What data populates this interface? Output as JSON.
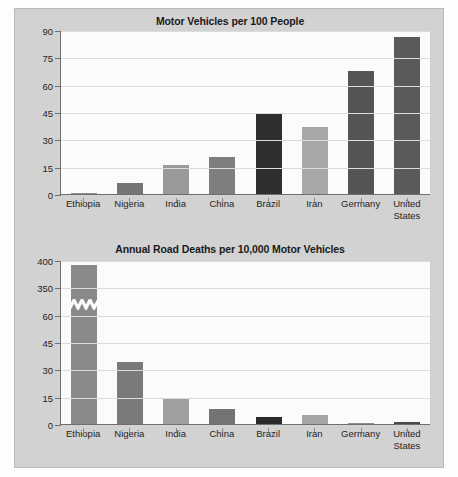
{
  "figure": {
    "background_color": "#d2d2d2",
    "plot_background_color": "#fbfbfb",
    "axis_color": "#6f6f6f",
    "grid_color": "#dcdcdc"
  },
  "charts": [
    {
      "title": "Motor Vehicles per 100 People",
      "yticks": [
        "0",
        "15",
        "30",
        "45",
        "60",
        "75",
        "90"
      ],
      "xlabels": [
        "Ethiopia",
        "Nigeria",
        "India",
        "China",
        "Brazil",
        "Iran",
        "Germany",
        "United\nStates"
      ]
    },
    {
      "title": "Annual Road Deaths per 10,000 Motor Vehicles",
      "yticks": [
        "0",
        "15",
        "30",
        "45",
        "60",
        "350",
        "400"
      ],
      "xlabels": [
        "Ethiopia",
        "Nigeria",
        "India",
        "China",
        "Brazil",
        "Iran",
        "Germany",
        "United\nStates"
      ]
    }
  ],
  "chart_data": [
    {
      "type": "bar",
      "title": "Motor Vehicles per 100 People",
      "xlabel": "",
      "ylabel": "",
      "categories": [
        "Ethiopia",
        "Nigeria",
        "India",
        "China",
        "Brazil",
        "Iran",
        "Germany",
        "United States"
      ],
      "values": [
        0.5,
        6,
        16,
        20.5,
        44,
        37,
        67.5,
        86
      ],
      "bar_colors": [
        "#8f8f8f",
        "#757575",
        "#9a9a9a",
        "#7e7e7e",
        "#2f2f2f",
        "#a8a8a8",
        "#555555",
        "#5a5a5a"
      ],
      "ylim": [
        0,
        90
      ],
      "ytick_values": [
        0,
        15,
        30,
        45,
        60,
        75,
        90
      ],
      "grid": true,
      "broken_axis": false,
      "legend": "none"
    },
    {
      "type": "bar",
      "title": "Annual Road Deaths per 10,000 Motor Vehicles",
      "xlabel": "",
      "ylabel": "",
      "categories": [
        "Ethiopia",
        "Nigeria",
        "India",
        "China",
        "Brazil",
        "Iran",
        "Germany",
        "United States"
      ],
      "values": [
        390,
        34,
        14.5,
        8,
        4,
        4.8,
        0.3,
        1
      ],
      "bar_colors": [
        "#8a8a8a",
        "#7a7a7a",
        "#a0a0a0",
        "#747474",
        "#2b2b2b",
        "#a6a6a6",
        "#8e8e8e",
        "#4a4a4a"
      ],
      "ylim": [
        0,
        400
      ],
      "ytick_values": [
        0,
        15,
        30,
        45,
        60,
        350,
        400
      ],
      "grid": true,
      "broken_axis": true,
      "axis_break_note": "y-axis break between 60 and 350; Ethiopia bar drawn with zigzag break marker",
      "legend": "none"
    }
  ]
}
